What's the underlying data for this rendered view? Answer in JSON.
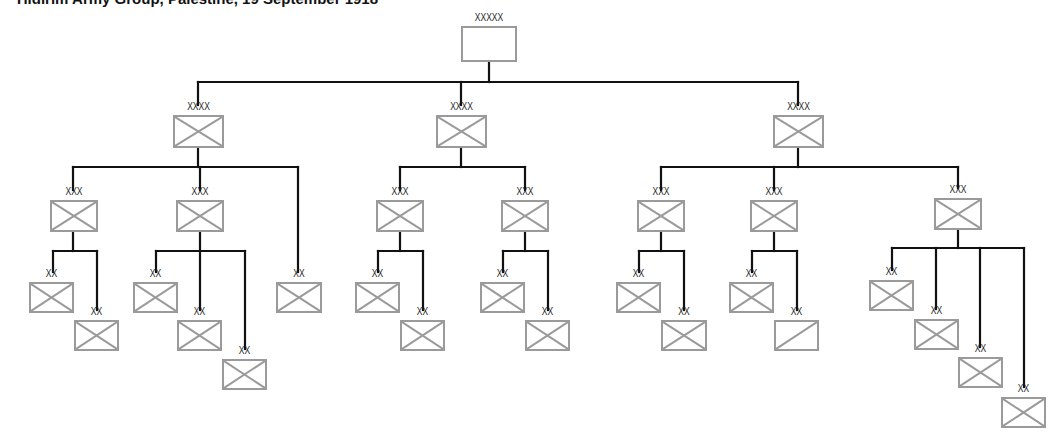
{
  "colors": {
    "line": "#111111",
    "box_border": "#9a9a9a"
  },
  "units": [
    {
      "id": "yildirim",
      "name": "Yildirim Army Group",
      "echelon": "XXXXX",
      "symbol": "empty",
      "box": [
        461,
        26,
        56,
        36
      ]
    },
    {
      "id": "eighth",
      "name": "Eighth",
      "echelon": "XXXX",
      "symbol": "infantry",
      "box": [
        173,
        115,
        51,
        33
      ]
    },
    {
      "id": "seventh",
      "name": "Seventh",
      "echelon": "XXXX",
      "symbol": "infantry",
      "box": [
        436,
        115,
        51,
        33
      ]
    },
    {
      "id": "fourth",
      "name": "Fourth",
      "echelon": "XXXX",
      "symbol": "infantry",
      "box": [
        773,
        115,
        51,
        33
      ]
    },
    {
      "id": "xxii",
      "name": "XXII",
      "echelon": "XXX",
      "symbol": "infantry",
      "box": [
        50,
        200,
        48,
        32
      ]
    },
    {
      "id": "leftwing",
      "name": "Left Wing|Group",
      "echelon": "XXX",
      "symbol": "infantry",
      "box": [
        176,
        200,
        48,
        32
      ]
    },
    {
      "id": "d46",
      "name": "46",
      "echelon": "XX",
      "symbol": "infantry",
      "box": [
        276,
        282,
        46,
        31
      ]
    },
    {
      "id": "iii",
      "name": "III",
      "echelon": "XXX",
      "symbol": "infantry",
      "box": [
        376,
        200,
        48,
        32
      ]
    },
    {
      "id": "xx",
      "name": "XX",
      "echelon": "XXX",
      "symbol": "infantry",
      "box": [
        501,
        200,
        48,
        32
      ]
    },
    {
      "id": "viii",
      "name": "VIII",
      "echelon": "XXX",
      "symbol": "infantry",
      "box": [
        637,
        200,
        48,
        32
      ]
    },
    {
      "id": "seria",
      "name": "Şeria|Group",
      "echelon": "XXX",
      "symbol": "infantry",
      "box": [
        750,
        200,
        48,
        32
      ]
    },
    {
      "id": "ii",
      "name": "II",
      "echelon": "XXX",
      "symbol": "infantry",
      "box": [
        934,
        198,
        48,
        32
      ]
    },
    {
      "id": "d20",
      "name": "20",
      "echelon": "XX",
      "symbol": "infantry",
      "box": [
        29,
        282,
        45,
        31
      ]
    },
    {
      "id": "d7",
      "name": "7",
      "echelon": "XX",
      "symbol": "infantry",
      "box": [
        74,
        320,
        45,
        31
      ]
    },
    {
      "id": "d16",
      "name": "16",
      "echelon": "XX",
      "symbol": "infantry",
      "box": [
        133,
        282,
        45,
        31
      ]
    },
    {
      "id": "d19",
      "name": "19",
      "echelon": "XX",
      "symbol": "infantry",
      "box": [
        177,
        320,
        45,
        31
      ]
    },
    {
      "id": "gac",
      "name": "German Asia|Corps",
      "echelon": "XX",
      "symbol": "infantry",
      "box": [
        222,
        359,
        45,
        31
      ]
    },
    {
      "id": "d1",
      "name": "1",
      "echelon": "XX",
      "symbol": "infantry",
      "box": [
        355,
        282,
        45,
        31
      ]
    },
    {
      "id": "d11",
      "name": "11",
      "echelon": "XX",
      "symbol": "infantry",
      "box": [
        400,
        320,
        45,
        31
      ]
    },
    {
      "id": "d26",
      "name": "26",
      "echelon": "XX",
      "symbol": "infantry",
      "box": [
        480,
        282,
        45,
        31
      ]
    },
    {
      "id": "d53",
      "name": "53",
      "echelon": "XX",
      "symbol": "infantry",
      "box": [
        525,
        320,
        45,
        31
      ]
    },
    {
      "id": "d48",
      "name": "48",
      "echelon": "XX",
      "symbol": "infantry",
      "box": [
        616,
        282,
        45,
        31
      ]
    },
    {
      "id": "provdiv",
      "name": "Provisional|Division",
      "echelon": "XX",
      "symbol": "infantry",
      "box": [
        661,
        320,
        46,
        31
      ]
    },
    {
      "id": "d24",
      "name": "24",
      "echelon": "XX",
      "symbol": "infantry",
      "box": [
        729,
        282,
        45,
        31
      ]
    },
    {
      "id": "d3",
      "name": "3",
      "echelon": "XX",
      "symbol": "cavalry",
      "box": [
        774,
        320,
        45,
        31
      ]
    },
    {
      "id": "damascus",
      "name": "Damascus|Force",
      "echelon": "XX",
      "symbol": "infantry",
      "box": [
        869,
        280,
        45,
        31
      ]
    },
    {
      "id": "havral",
      "name": "Havral|Force",
      "echelon": "XX",
      "symbol": "infantry",
      "box": [
        914,
        319,
        45,
        31
      ]
    },
    {
      "id": "maan",
      "name": "Maan|Force",
      "echelon": "XX",
      "symbol": "infantry",
      "box": [
        958,
        357,
        45,
        31
      ]
    },
    {
      "id": "d62",
      "name": "62",
      "echelon": "XX",
      "symbol": "infantry",
      "box": [
        1001,
        397,
        45,
        31
      ]
    }
  ],
  "connectors": [
    [
      489,
      62,
      489,
      82
    ],
    [
      198,
      82,
      798,
      82
    ],
    [
      198,
      82,
      198,
      105
    ],
    [
      461,
      82,
      461,
      105
    ],
    [
      798,
      82,
      798,
      105
    ],
    [
      198,
      148,
      198,
      167
    ],
    [
      73,
      167,
      298,
      167
    ],
    [
      73,
      167,
      73,
      190
    ],
    [
      200,
      167,
      200,
      190
    ],
    [
      298,
      167,
      298,
      272
    ],
    [
      73,
      232,
      73,
      251
    ],
    [
      53,
      251,
      97,
      251
    ],
    [
      53,
      251,
      53,
      272
    ],
    [
      97,
      251,
      97,
      310
    ],
    [
      200,
      232,
      200,
      251
    ],
    [
      156,
      251,
      245,
      251
    ],
    [
      156,
      251,
      156,
      272
    ],
    [
      200,
      251,
      200,
      310
    ],
    [
      245,
      251,
      245,
      349
    ],
    [
      461,
      148,
      461,
      167
    ],
    [
      400,
      167,
      525,
      167
    ],
    [
      400,
      167,
      400,
      190
    ],
    [
      525,
      167,
      525,
      190
    ],
    [
      400,
      232,
      400,
      251
    ],
    [
      378,
      251,
      423,
      251
    ],
    [
      378,
      251,
      378,
      272
    ],
    [
      423,
      251,
      423,
      310
    ],
    [
      525,
      232,
      525,
      251
    ],
    [
      503,
      251,
      548,
      251
    ],
    [
      503,
      251,
      503,
      272
    ],
    [
      548,
      251,
      548,
      310
    ],
    [
      798,
      148,
      798,
      167
    ],
    [
      661,
      167,
      958,
      167
    ],
    [
      661,
      167,
      661,
      190
    ],
    [
      774,
      167,
      774,
      190
    ],
    [
      958,
      167,
      958,
      188
    ],
    [
      661,
      232,
      661,
      251
    ],
    [
      639,
      251,
      684,
      251
    ],
    [
      639,
      251,
      639,
      272
    ],
    [
      684,
      251,
      684,
      310
    ],
    [
      774,
      232,
      774,
      251
    ],
    [
      752,
      251,
      797,
      251
    ],
    [
      752,
      251,
      752,
      272
    ],
    [
      797,
      251,
      797,
      310
    ],
    [
      958,
      230,
      958,
      248
    ],
    [
      892,
      248,
      1024,
      248
    ],
    [
      892,
      248,
      892,
      270
    ],
    [
      936,
      248,
      936,
      309
    ],
    [
      980,
      248,
      980,
      347
    ],
    [
      1024,
      248,
      1024,
      387
    ]
  ]
}
